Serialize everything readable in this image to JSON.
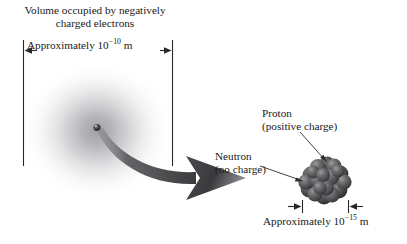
{
  "figure": {
    "background_color": "#ffffff",
    "text_color": "#1a1a1a"
  },
  "atom": {
    "caption_line1": "Volume occupied by negatively",
    "caption_line2": "charged electrons",
    "dimension": {
      "prefix": "Approximately 10",
      "exponent": "−10",
      "unit": " m",
      "full_text": "Approximately 10−10 m"
    },
    "cloud_color": "#b9b9bd",
    "electron_cloud_name": "electron-cloud",
    "nucleus_dot_name": "atom-nucleus-dot"
  },
  "nucleus": {
    "proton_line1": "Proton",
    "proton_line2": "(positive charge)",
    "neutron_line1": "Neutron",
    "neutron_line2": "(no charge)",
    "dimension": {
      "prefix": "Approximately 10",
      "exponent": "−15",
      "unit": " m",
      "full_text": "Approximately 10−15 m"
    },
    "particle_color": "#58585a",
    "particle_count": 19
  },
  "pointer": {
    "zoom_arrow_name": "magnification-arrow",
    "zoom_arrow_color": "#4a4a4c"
  }
}
